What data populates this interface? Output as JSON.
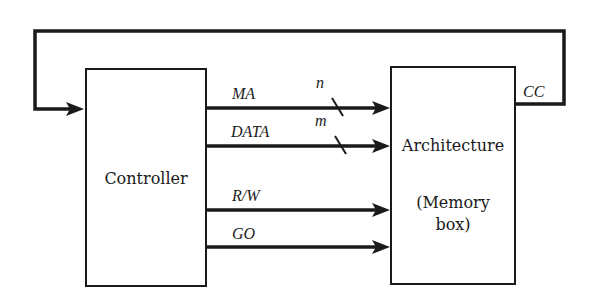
{
  "diagram": {
    "controller": {
      "label": "Controller"
    },
    "architecture": {
      "label_line1": "Architecture",
      "label_line2": "(Memory",
      "label_line3": "box)"
    },
    "signals": [
      {
        "label": "MA",
        "width_label": "n"
      },
      {
        "label": "DATA",
        "width_label": "m"
      },
      {
        "label": "R/W"
      },
      {
        "label": "GO"
      }
    ],
    "feedback": {
      "label": "CC"
    }
  }
}
